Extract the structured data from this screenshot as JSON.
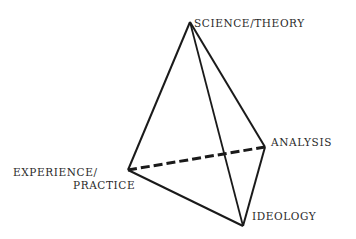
{
  "diagram": {
    "type": "tetrahedron",
    "vertices": {
      "top": {
        "label": "SCIENCE/THEORY",
        "x": 190,
        "y": 22
      },
      "left": {
        "label_line1": "EXPERIENCE/",
        "label_line2": "PRACTICE",
        "x": 128,
        "y": 170
      },
      "right": {
        "label": "ANALYSIS",
        "x": 265,
        "y": 147
      },
      "bottom": {
        "label": "IDEOLOGY",
        "x": 243,
        "y": 226
      }
    },
    "edges": [
      {
        "from": "top",
        "to": "left",
        "style": "solid"
      },
      {
        "from": "top",
        "to": "right",
        "style": "solid"
      },
      {
        "from": "top",
        "to": "bottom",
        "style": "solid"
      },
      {
        "from": "left",
        "to": "bottom",
        "style": "solid"
      },
      {
        "from": "right",
        "to": "bottom",
        "style": "solid"
      },
      {
        "from": "left",
        "to": "right",
        "style": "dashed"
      }
    ],
    "line_color": "#1a1a1a"
  }
}
